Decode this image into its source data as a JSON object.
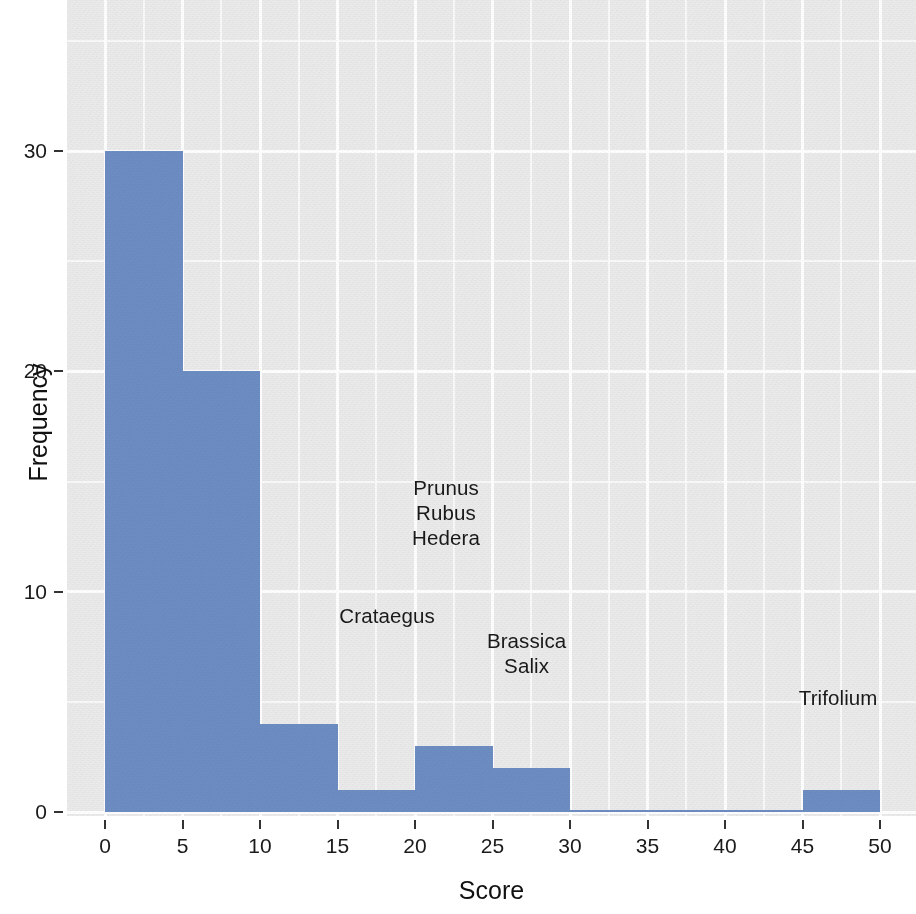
{
  "chart_data": {
    "type": "bar",
    "title": "",
    "subtitle": "",
    "xlabel": "Score",
    "ylabel": "Frequency",
    "xlim": [
      0,
      50
    ],
    "ylim": [
      0,
      35
    ],
    "bin_width": 5,
    "grid": true,
    "legend": "none",
    "bar_color": "#6d8ec4",
    "panel_color": "#ebebeb",
    "gridline_color": "#ffffff",
    "categories": [
      "0-5",
      "5-10",
      "10-15",
      "15-20",
      "20-25",
      "25-30",
      "30-35",
      "35-40",
      "40-45",
      "45-50"
    ],
    "bin_starts": [
      0,
      5,
      10,
      15,
      20,
      25,
      30,
      35,
      40,
      45
    ],
    "values": [
      30,
      20,
      4,
      1,
      3,
      2,
      0,
      0,
      0,
      1
    ],
    "series": [
      {
        "name": "Frequency",
        "values": [
          30,
          20,
          4,
          1,
          3,
          2,
          0,
          0,
          0,
          1
        ]
      }
    ],
    "x_ticks": [
      0,
      5,
      10,
      15,
      20,
      25,
      30,
      35,
      40,
      45,
      50
    ],
    "x_tick_labels": [
      "0",
      "5",
      "10",
      "15",
      "20",
      "25",
      "30",
      "35",
      "40",
      "45",
      "50"
    ],
    "y_ticks": [
      0,
      10,
      20,
      30
    ],
    "y_tick_labels": [
      "0",
      "10",
      "20",
      "30"
    ],
    "y_minor_ticks": [
      5,
      15,
      25,
      35
    ],
    "x_minor_ticks": [
      2.5,
      7.5,
      12.5,
      17.5,
      22.5,
      27.5,
      32.5,
      37.5,
      42.5,
      47.5
    ],
    "annotations": [
      {
        "text": "Prunus\nRubus\nHedera",
        "lines": [
          "Prunus",
          "Rubus",
          "Hedera"
        ],
        "x": 22.0,
        "y": 13.6
      },
      {
        "text": "Crataegus",
        "lines": [
          "Crataegus"
        ],
        "x": 18.2,
        "y": 8.9
      },
      {
        "text": "Brassica\nSalix",
        "lines": [
          "Brassica",
          "Salix"
        ],
        "x": 27.2,
        "y": 7.2
      },
      {
        "text": "Trifolium",
        "lines": [
          "Trifolium"
        ],
        "x": 47.3,
        "y": 5.2
      }
    ]
  },
  "axes": {
    "x_title": "Score",
    "y_title": "Frequency"
  }
}
